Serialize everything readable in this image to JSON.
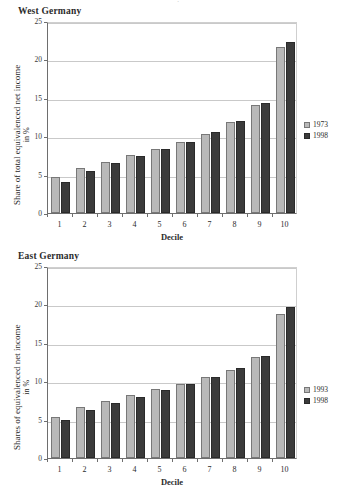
{
  "page": {
    "cropped_header_text": "."
  },
  "chart_data": [
    {
      "type": "bar",
      "title": "West Germany",
      "xlabel": "Decile",
      "ylabel": "Share of total equivalenced net income",
      "ylabel_line2": "in %",
      "categories": [
        "1",
        "2",
        "3",
        "4",
        "5",
        "6",
        "7",
        "8",
        "9",
        "10"
      ],
      "yticks": [
        "0",
        "5",
        "10",
        "15",
        "20",
        "25"
      ],
      "ylim": [
        0,
        25
      ],
      "grid": true,
      "legend_position": "right",
      "series": [
        {
          "name": "1973",
          "color": "#b9b9b9",
          "values": [
            4.7,
            5.9,
            6.7,
            7.5,
            8.4,
            9.3,
            10.3,
            11.8,
            14.0,
            21.6
          ]
        },
        {
          "name": "1998",
          "color": "#3b3b3b",
          "values": [
            4.1,
            5.5,
            6.5,
            7.4,
            8.3,
            9.3,
            10.5,
            12.0,
            14.3,
            22.3
          ]
        }
      ]
    },
    {
      "type": "bar",
      "title": "East Germany",
      "xlabel": "Decile",
      "ylabel": "Shares of equivalenced net income",
      "ylabel_line2": "in %",
      "categories": [
        "1",
        "2",
        "3",
        "4",
        "5",
        "6",
        "7",
        "8",
        "9",
        "10"
      ],
      "yticks": [
        "0",
        "5",
        "10",
        "15",
        "20",
        "25"
      ],
      "ylim": [
        0,
        25
      ],
      "grid": true,
      "legend_position": "right",
      "series": [
        {
          "name": "1993",
          "color": "#b9b9b9",
          "values": [
            5.3,
            6.6,
            7.4,
            8.2,
            9.0,
            9.7,
            10.5,
            11.5,
            13.2,
            18.8
          ]
        },
        {
          "name": "1998",
          "color": "#3b3b3b",
          "values": [
            5.0,
            6.3,
            7.2,
            8.0,
            8.9,
            9.6,
            10.5,
            11.7,
            13.3,
            19.7
          ]
        }
      ]
    }
  ]
}
